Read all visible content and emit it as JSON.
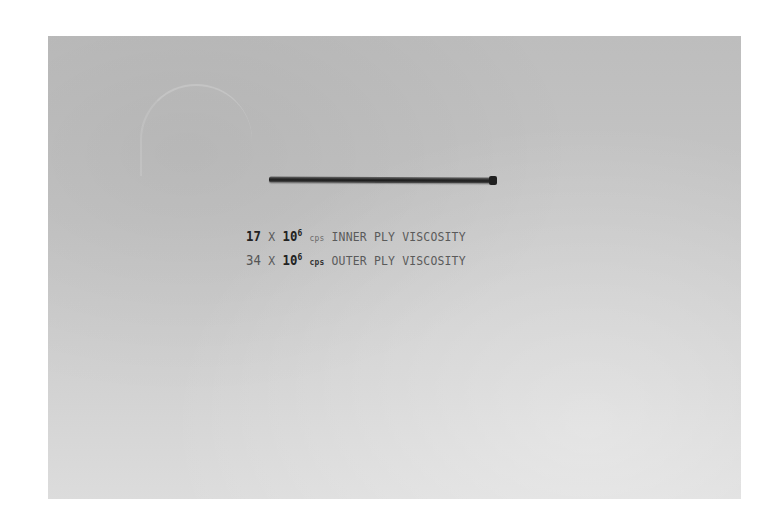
{
  "photo": {
    "description": "Grayscale photograph of a thin rod specimen on a light gray background with typed caption",
    "background_color": "#c8c8c8",
    "specimen_color": "#2a2a2a"
  },
  "caption": {
    "line1": {
      "coefficient": "17",
      "times": "X",
      "base": "10",
      "exponent": "6",
      "unit": "cps",
      "label": "INNER PLY VISCOSITY"
    },
    "line2": {
      "coefficient": "34",
      "times": "X",
      "base": "10",
      "exponent": "6",
      "unit": "cps",
      "label": "OUTER PLY VISCOSITY"
    }
  }
}
